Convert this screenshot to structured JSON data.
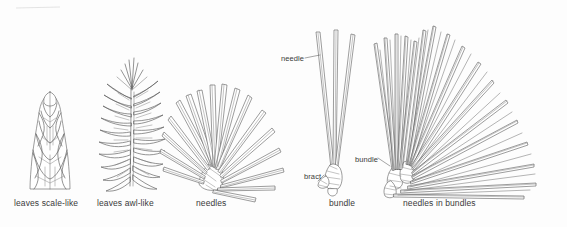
{
  "figure": {
    "type": "botanical-line-illustration-plate",
    "background_color": "#fdfdfd",
    "ink_color": "#555555",
    "text_color": "#3a3a3a",
    "width": 567,
    "height": 227
  },
  "captions": {
    "scale_like": "leaves scale-like",
    "awl_like": "leaves awl-like",
    "needles": "needles",
    "bundle": "bundle",
    "needles_in_bundles": "needles in bundles"
  },
  "callouts": {
    "needle": "needle",
    "bract": "bract",
    "bundle": "bundle"
  },
  "panels": [
    {
      "id": "panel-scale-like",
      "caption": "leaves scale-like",
      "description": "tapered shoot tip covered in overlapping diamond-shaped scale leaves"
    },
    {
      "id": "panel-awl-like",
      "caption": "leaves awl-like",
      "description": "shoot with dense spreading awl-shaped leaves along a central axis"
    },
    {
      "id": "panel-needles",
      "caption": "needles",
      "description": "fan of flat broad needles radiating from a short woody base"
    },
    {
      "id": "panel-bundle",
      "caption": "bundle",
      "description": "three long needles joined at base in a sheathed bundle with bract"
    },
    {
      "id": "panel-needles-in-bundles",
      "caption": "needles in bundles",
      "description": "large spreading fan of many long slender needles arising from several bundles"
    }
  ]
}
